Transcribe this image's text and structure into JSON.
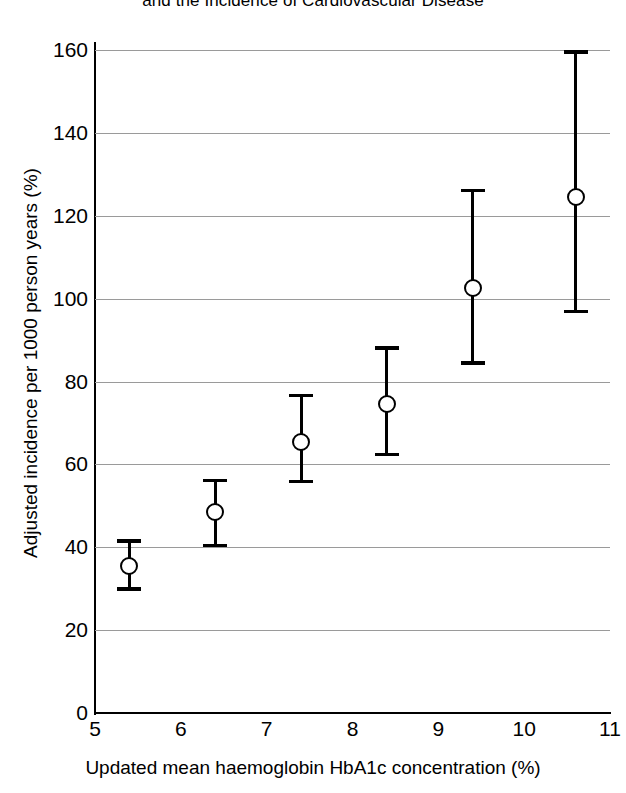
{
  "chart_data": {
    "type": "scatter",
    "title": "and the Incidence of Cardiovascular Disease",
    "subtitle": "",
    "xlabel": "Updated mean haemoglobin HbA1c concentration (%)",
    "ylabel": "Adjusted incidence per 1000 person years (%)",
    "xlim": [
      5,
      11
    ],
    "ylim": [
      0,
      160
    ],
    "xticks": [
      "5",
      "6",
      "7",
      "8",
      "9",
      "10",
      "11"
    ],
    "xtick_values": [
      5,
      6,
      7,
      8,
      9,
      10,
      11
    ],
    "yticks": [
      "0",
      "20",
      "40",
      "60",
      "80",
      "100",
      "120",
      "140",
      "160"
    ],
    "ytick_values": [
      0,
      20,
      40,
      60,
      80,
      100,
      120,
      140,
      160
    ],
    "grid": "horizontal",
    "legend": "none",
    "error_bars": "95% confidence interval",
    "marker_style": "open-circle",
    "x": [
      5.4,
      6.4,
      7.4,
      8.4,
      9.4,
      10.6
    ],
    "y": [
      35.5,
      48.5,
      65.5,
      74.5,
      102.5,
      124.5
    ],
    "y_lower": [
      29.5,
      40.0,
      55.5,
      62.0,
      84.0,
      96.5
    ],
    "y_upper": [
      42.0,
      56.5,
      77.0,
      88.5,
      126.5,
      160.0
    ],
    "points": [
      {
        "x": 5.4,
        "y": 35.5,
        "low": 29.5,
        "high": 42.0
      },
      {
        "x": 6.4,
        "y": 48.5,
        "low": 40.0,
        "high": 56.5
      },
      {
        "x": 7.4,
        "y": 65.5,
        "low": 55.5,
        "high": 77.0
      },
      {
        "x": 8.4,
        "y": 74.5,
        "low": 62.0,
        "high": 88.5
      },
      {
        "x": 9.4,
        "y": 102.5,
        "low": 84.0,
        "high": 126.5
      },
      {
        "x": 10.6,
        "y": 124.5,
        "low": 96.5,
        "high": 160.0
      }
    ],
    "colors": {
      "marker": "#000000",
      "error_bar": "#000000",
      "grid": "#9a9a9a",
      "axis": "#000000",
      "background": "#ffffff"
    }
  }
}
